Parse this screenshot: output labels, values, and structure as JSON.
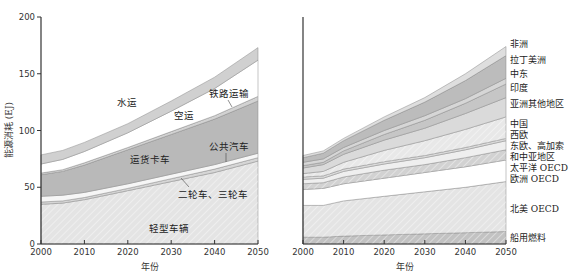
{
  "chart_data": [
    {
      "type": "area",
      "stacked": true,
      "title": "",
      "xlabel": "年份",
      "ylabel": "能源消耗 (EJ)",
      "xlim": [
        2000,
        2050
      ],
      "ylim": [
        0,
        200
      ],
      "xticks": [
        2000,
        2010,
        2020,
        2030,
        2040,
        2050
      ],
      "yticks": [
        0,
        50,
        100,
        150,
        200
      ],
      "grid": false,
      "x": [
        2000,
        2005,
        2010,
        2020,
        2030,
        2040,
        2050
      ],
      "series": [
        {
          "name": "轻型车辆",
          "color": "#e4e4e4",
          "hatch": true,
          "values": [
            35,
            36,
            39,
            47,
            55,
            63,
            73
          ]
        },
        {
          "name": "二轮车、三轮车",
          "color": "#d6d6d6",
          "hatch": false,
          "values": [
            2,
            2,
            2,
            2,
            2.5,
            3,
            3
          ]
        },
        {
          "name": "公共汽车",
          "color": "#f6f6f6",
          "hatch": false,
          "values": [
            5,
            5,
            4.5,
            4,
            4,
            4,
            4
          ]
        },
        {
          "name": "运货卡车",
          "color": "#b9b9b9",
          "hatch": false,
          "values": [
            19,
            21,
            24,
            30,
            35,
            40,
            46
          ]
        },
        {
          "name": "铁路运输",
          "color": "#d2d2d2",
          "hatch": false,
          "values": [
            1.5,
            1.5,
            2,
            2,
            2.5,
            3,
            4
          ]
        },
        {
          "name": "空运",
          "color": "#ffffff",
          "hatch": false,
          "values": [
            8,
            9,
            10,
            13,
            18,
            24,
            32
          ]
        },
        {
          "name": "水运",
          "color": "#d0d0d0",
          "hatch": false,
          "values": [
            8,
            8,
            8,
            8,
            9,
            10,
            11
          ]
        }
      ],
      "annotations": [
        "水运",
        "空运",
        "铁路运输",
        "公共汽车",
        "运货卡车",
        "二轮车、三轮车",
        "轻型车辆"
      ]
    },
    {
      "type": "area",
      "stacked": true,
      "title": "",
      "xlabel": "年份",
      "ylabel": "",
      "xlim": [
        2000,
        2050
      ],
      "ylim": [
        0,
        200
      ],
      "xticks": [
        2000,
        2010,
        2020,
        2030,
        2040,
        2050
      ],
      "grid": false,
      "legend_position": "right",
      "x": [
        2000,
        2005,
        2010,
        2020,
        2030,
        2040,
        2050
      ],
      "series": [
        {
          "name": "船用燃料",
          "color": "#c2c2c2",
          "hatch": true,
          "values": [
            6,
            6,
            7,
            8,
            9,
            10,
            11
          ]
        },
        {
          "name": "北美 OECD",
          "color": "#e4e4e4",
          "hatch": true,
          "values": [
            28,
            28,
            31,
            34,
            37,
            40,
            44
          ]
        },
        {
          "name": "欧洲 OECD",
          "color": "#ffffff",
          "hatch": false,
          "values": [
            14,
            15,
            15,
            16,
            17,
            18,
            19
          ]
        },
        {
          "name": "太平洋 OECD",
          "color": "#d2d2d2",
          "hatch": true,
          "values": [
            5,
            5,
            6,
            7,
            7,
            8,
            9
          ]
        },
        {
          "name": "东欧、高加索和中亚地区",
          "color": "#efefef",
          "hatch": false,
          "values": [
            4,
            4,
            5,
            5.5,
            6,
            7,
            8
          ]
        },
        {
          "name": "西欧",
          "color": "#dcdcdc",
          "hatch": false,
          "values": [
            2,
            2,
            2,
            2,
            2,
            2,
            2
          ]
        },
        {
          "name": "中国",
          "color": "#e8e8e8",
          "hatch": true,
          "values": [
            3,
            4,
            6,
            10,
            13,
            16,
            19
          ]
        },
        {
          "name": "亚洲其他地区",
          "color": "#dadada",
          "hatch": false,
          "values": [
            5,
            6,
            7,
            9,
            11,
            14,
            17
          ]
        },
        {
          "name": "印度",
          "color": "#c6c6c6",
          "hatch": false,
          "values": [
            2,
            2,
            3,
            5,
            7,
            9,
            12
          ]
        },
        {
          "name": "中东",
          "color": "#d6d6d6",
          "hatch": false,
          "values": [
            3,
            3,
            3,
            3.5,
            4,
            4,
            5
          ]
        },
        {
          "name": "拉丁美洲",
          "color": "#bcbcbc",
          "hatch": false,
          "values": [
            4,
            5,
            6,
            9,
            12,
            16,
            20
          ]
        },
        {
          "name": "非洲",
          "color": "#dedede",
          "hatch": false,
          "values": [
            2,
            2,
            2,
            3,
            4,
            6,
            8
          ]
        }
      ],
      "legend": [
        "非洲",
        "拉丁美洲",
        "中东",
        "印度",
        "亚洲其他地区",
        "中国",
        "西欧",
        "东欧、高加索",
        "和中亚地区",
        "太平洋 OECD",
        "欧洲 OECD",
        "北美 OECD",
        "船用燃料"
      ]
    }
  ],
  "left_chart": {
    "ylabel": "能源消耗 (EJ)",
    "xlabel": "年份",
    "yticks": [
      "0",
      "50",
      "100",
      "150",
      "200"
    ],
    "xticks": [
      "2000",
      "2010",
      "2020",
      "2030",
      "2040",
      "2050"
    ],
    "labels": {
      "water": "水运",
      "air": "空运",
      "rail": "铁路运输",
      "bus": "公共汽车",
      "truck": "运货卡车",
      "two_wheel": "二轮车、三轮车",
      "ldv": "轻型车辆"
    }
  },
  "right_chart": {
    "xlabel": "年份",
    "xticks": [
      "2000",
      "2010",
      "2020",
      "2030",
      "2040",
      "2050"
    ],
    "legend": [
      {
        "text": "非洲",
        "y": 47
      },
      {
        "text": "拉丁美洲",
        "y": 63
      },
      {
        "text": "中东",
        "y": 77
      },
      {
        "text": "印度",
        "y": 91
      },
      {
        "text": "亚洲其他地区",
        "y": 107
      },
      {
        "text": "中国",
        "y": 127
      },
      {
        "text": "西欧",
        "y": 138
      },
      {
        "text": "东欧、高加索",
        "y": 149
      },
      {
        "text": "和中亚地区",
        "y": 160
      },
      {
        "text": "太平洋 OECD",
        "y": 171
      },
      {
        "text": "欧洲 OECD",
        "y": 182
      },
      {
        "text": "北美 OECD",
        "y": 212
      },
      {
        "text": "船用燃料",
        "y": 241
      }
    ]
  }
}
